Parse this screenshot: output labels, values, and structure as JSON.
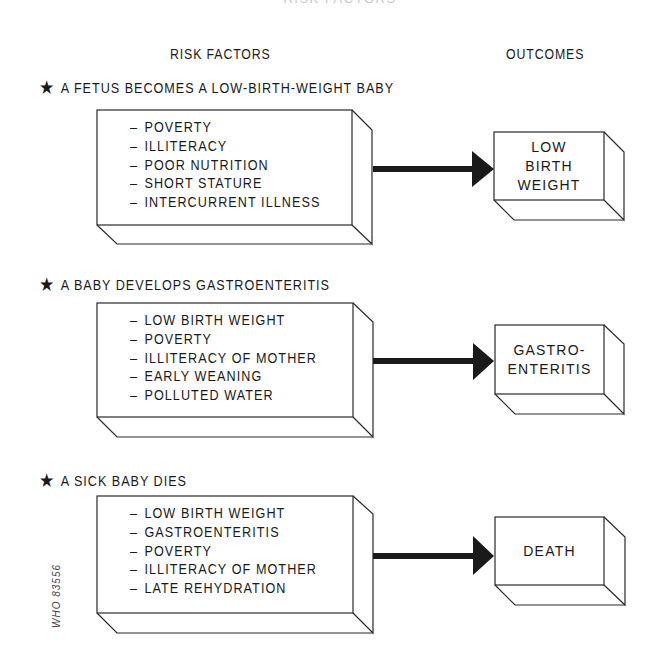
{
  "header": {
    "cut_off_title": "RISK FACTORS",
    "column_risk_factors": "RISK FACTORS",
    "column_outcomes": "OUTCOMES"
  },
  "sections": [
    {
      "star_icon": "★",
      "title": "A FETUS BECOMES A LOW-BIRTH-WEIGHT BABY",
      "dash": "–",
      "risk_factors": [
        "POVERTY",
        "ILLITERACY",
        "POOR NUTRITION",
        "SHORT STATURE",
        "INTERCURRENT ILLNESS"
      ],
      "outcome_lines": [
        "LOW",
        "BIRTH",
        "WEIGHT"
      ]
    },
    {
      "star_icon": "★",
      "title": "A BABY DEVELOPS GASTROENTERITIS",
      "dash": "–",
      "risk_factors": [
        "LOW BIRTH WEIGHT",
        "POVERTY",
        "ILLITERACY OF MOTHER",
        "EARLY WEANING",
        "POLLUTED WATER"
      ],
      "outcome_lines": [
        "GASTRO-",
        "ENTERITIS"
      ]
    },
    {
      "star_icon": "★",
      "title": "A SICK BABY DIES",
      "dash": "–",
      "risk_factors": [
        "LOW BIRTH WEIGHT",
        "GASTROENTERITIS",
        "POVERTY",
        "ILLITERACY OF MOTHER",
        "LATE REHYDRATION"
      ],
      "outcome_lines": [
        "DEATH"
      ]
    }
  ],
  "catalog_number": "WHO 83556",
  "colors": {
    "line": "#2a2a2a",
    "arrow": "#1a1a1a",
    "background": "#ffffff"
  }
}
